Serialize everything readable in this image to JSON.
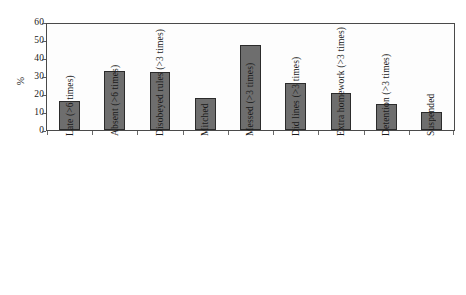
{
  "chart_data": {
    "type": "bar",
    "title": "",
    "subtitle": "",
    "xlabel": "",
    "ylabel": "%",
    "ylim": [
      0,
      60
    ],
    "ytick_step": 10,
    "yticks": [
      0,
      10,
      20,
      30,
      40,
      50,
      60
    ],
    "ytick_labels": [
      "0",
      "10",
      "20",
      "30",
      "40",
      "50",
      "60"
    ],
    "grid": false,
    "legend": false,
    "legend_position": "none",
    "bar_color": "#6e6e6e",
    "bar_edge_color": "#2b2b2b",
    "axis_color": "#4a4a4a",
    "background_color": "#ffffff",
    "xtick_label_rotation": 90,
    "categories": [
      "Late (>6 times)",
      "Absent (>6 times)",
      "Disobeyed rules (>3 times)",
      "Mitched",
      "Messed (>3 times)",
      "Did lines (>3 times)",
      "Extra homework (>3 times)",
      "Detention (>3 times)",
      "Suspended"
    ],
    "values": [
      16.5,
      33.5,
      33,
      18,
      48,
      26.5,
      21,
      15,
      10
    ]
  }
}
